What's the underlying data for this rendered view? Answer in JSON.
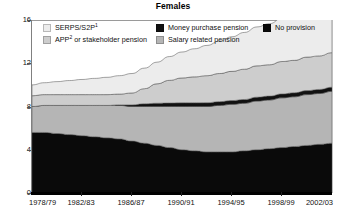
{
  "chart_data": {
    "type": "area",
    "title": "Females",
    "xlabel": "",
    "ylabel": "",
    "ylim": [
      0,
      16
    ],
    "y_ticks": [
      0,
      4,
      8,
      12,
      16
    ],
    "grid": false,
    "stacked": true,
    "legend_position": "top-inside",
    "x": [
      "1978/79",
      "1979/80",
      "1980/81",
      "1981/82",
      "1982/83",
      "1983/84",
      "1984/85",
      "1985/86",
      "1986/87",
      "1987/88",
      "1988/89",
      "1989/90",
      "1990/91",
      "1991/92",
      "1992/93",
      "1993/94",
      "1994/95",
      "1995/96",
      "1996/97",
      "1997/98",
      "1998/99",
      "1999/00",
      "2000/01",
      "2001/02",
      "2002/03"
    ],
    "tick_labels": [
      "1978/79",
      "1982/83",
      "1986/87",
      "1990/91",
      "1994/95",
      "1998/99",
      "2002/03"
    ],
    "tick_label_indices": [
      0,
      4,
      8,
      12,
      16,
      20,
      24
    ],
    "series": [
      {
        "name": "No provision",
        "color": "#0a0a0a",
        "values": [
          5.6,
          5.6,
          5.5,
          5.4,
          5.3,
          5.2,
          5.1,
          5.0,
          4.8,
          4.6,
          4.4,
          4.2,
          4.0,
          3.9,
          3.8,
          3.8,
          3.8,
          3.9,
          4.0,
          4.1,
          4.2,
          4.3,
          4.4,
          4.5,
          4.6
        ]
      },
      {
        "name": "Salary related pension",
        "color": "#b5b5b5",
        "values": [
          2.4,
          2.5,
          2.6,
          2.7,
          2.8,
          2.9,
          3.0,
          3.1,
          3.2,
          3.4,
          3.6,
          3.8,
          4.0,
          4.1,
          4.2,
          4.3,
          4.4,
          4.4,
          4.5,
          4.5,
          4.6,
          4.6,
          4.7,
          4.7,
          4.8
        ]
      },
      {
        "name": "Money purchase pension",
        "color": "#111111",
        "values": [
          0.0,
          0.0,
          0.0,
          0.0,
          0.0,
          0.0,
          0.0,
          0.05,
          0.15,
          0.25,
          0.3,
          0.32,
          0.34,
          0.34,
          0.35,
          0.35,
          0.35,
          0.35,
          0.36,
          0.36,
          0.36,
          0.37,
          0.37,
          0.38,
          0.38
        ]
      },
      {
        "name": "APP or stakeholder pension",
        "color": "#cdcdcd",
        "values": [
          1.0,
          1.0,
          1.0,
          1.0,
          1.0,
          1.0,
          1.0,
          1.0,
          1.1,
          1.4,
          1.8,
          2.1,
          2.3,
          2.4,
          2.5,
          2.6,
          2.7,
          2.8,
          2.9,
          2.9,
          3.0,
          3.0,
          3.1,
          3.1,
          3.2
        ]
      },
      {
        "name": "SERPS/S2P",
        "color": "#ececec",
        "values": [
          1.0,
          1.1,
          1.2,
          1.3,
          1.4,
          1.5,
          1.6,
          1.7,
          1.8,
          1.9,
          2.0,
          2.2,
          2.4,
          2.6,
          2.8,
          3.0,
          3.2,
          3.4,
          3.6,
          3.8,
          4.0,
          4.2,
          4.4,
          4.6,
          4.8
        ]
      }
    ]
  },
  "legend": {
    "items": [
      {
        "label": "SERPS/S2P",
        "sup": "1",
        "color": "#ececec",
        "name": "legend-serps-s2p"
      },
      {
        "label": "Money purchase pension",
        "sup": "",
        "color": "#111111",
        "name": "legend-money-purchase-pension"
      },
      {
        "label": "No provision",
        "sup": "",
        "color": "#0a0a0a",
        "name": "legend-no-provision"
      },
      {
        "label": "APP",
        "sup": "2",
        "label_rest": " or stakeholder pension",
        "color": "#cdcdcd",
        "name": "legend-app-or-stakeholder-pension"
      },
      {
        "label": "Salary related pension",
        "sup": "",
        "color": "#b5b5b5",
        "name": "legend-salary-related-pension"
      }
    ]
  }
}
